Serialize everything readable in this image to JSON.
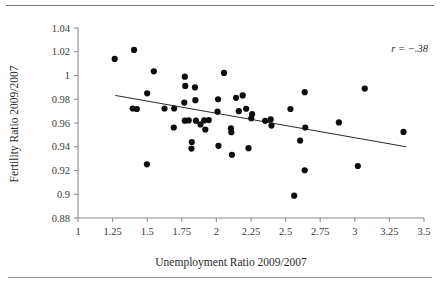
{
  "chart_data": {
    "type": "scatter",
    "title": "",
    "xlabel": "Unemployment Ratio 2009/2007",
    "ylabel": "Fertility Ratio 2009/2007",
    "xlim": [
      1,
      3.5
    ],
    "ylim": [
      0.88,
      1.04
    ],
    "xticks": [
      "1",
      "1.25",
      "1.5",
      "1.75",
      "2",
      "2.25",
      "2.5",
      "2.75",
      "3",
      "3.25",
      "3.5"
    ],
    "xtick_values": [
      1,
      1.25,
      1.5,
      1.75,
      2,
      2.25,
      2.5,
      2.75,
      3,
      3.25,
      3.5
    ],
    "yticks": [
      "1.04",
      "1.02",
      "1",
      "0.98",
      "0.96",
      "0.94",
      "0.92",
      "0.9",
      "0.88"
    ],
    "ytick_values": [
      1.04,
      1.02,
      1.0,
      0.98,
      0.96,
      0.94,
      0.92,
      0.9,
      0.88
    ],
    "grid": false,
    "legend": null,
    "annotation": "r = −.38",
    "correlation": -0.38,
    "marker": "filled-circle",
    "marker_color": "#0d0d0d",
    "trendline": {
      "type": "linear",
      "x": [
        1.27,
        3.37
      ],
      "y": [
        0.9832,
        0.94
      ],
      "color": "#2a2a2a"
    },
    "points": [
      {
        "x": 1.265,
        "y": 1.014
      },
      {
        "x": 1.405,
        "y": 1.0215
      },
      {
        "x": 1.395,
        "y": 0.9722
      },
      {
        "x": 1.425,
        "y": 0.9718
      },
      {
        "x": 1.5,
        "y": 0.985
      },
      {
        "x": 1.498,
        "y": 0.9252
      },
      {
        "x": 1.548,
        "y": 1.0035
      },
      {
        "x": 1.625,
        "y": 0.9722
      },
      {
        "x": 1.695,
        "y": 0.9722
      },
      {
        "x": 1.692,
        "y": 0.9562
      },
      {
        "x": 1.772,
        "y": 0.999
      },
      {
        "x": 1.775,
        "y": 0.9912
      },
      {
        "x": 1.768,
        "y": 0.9772
      },
      {
        "x": 1.772,
        "y": 0.962
      },
      {
        "x": 1.8,
        "y": 0.9622
      },
      {
        "x": 1.822,
        "y": 0.944
      },
      {
        "x": 1.82,
        "y": 0.9385
      },
      {
        "x": 1.845,
        "y": 0.99
      },
      {
        "x": 1.848,
        "y": 0.9792
      },
      {
        "x": 1.852,
        "y": 0.962
      },
      {
        "x": 1.885,
        "y": 0.9588
      },
      {
        "x": 1.912,
        "y": 0.9622
      },
      {
        "x": 1.92,
        "y": 0.9545
      },
      {
        "x": 1.945,
        "y": 0.9625
      },
      {
        "x": 2.012,
        "y": 0.98
      },
      {
        "x": 2.008,
        "y": 0.9695
      },
      {
        "x": 2.015,
        "y": 0.9408
      },
      {
        "x": 2.055,
        "y": 1.0022
      },
      {
        "x": 2.105,
        "y": 0.9555
      },
      {
        "x": 2.108,
        "y": 0.9522
      },
      {
        "x": 2.112,
        "y": 0.9332
      },
      {
        "x": 2.142,
        "y": 0.9812
      },
      {
        "x": 2.162,
        "y": 0.97
      },
      {
        "x": 2.19,
        "y": 0.9832
      },
      {
        "x": 2.215,
        "y": 0.972
      },
      {
        "x": 2.232,
        "y": 0.9388
      },
      {
        "x": 2.258,
        "y": 0.9675
      },
      {
        "x": 2.252,
        "y": 0.964
      },
      {
        "x": 2.352,
        "y": 0.9618
      },
      {
        "x": 2.392,
        "y": 0.963
      },
      {
        "x": 2.398,
        "y": 0.9578
      },
      {
        "x": 2.535,
        "y": 0.9718
      },
      {
        "x": 2.562,
        "y": 0.8988
      },
      {
        "x": 2.605,
        "y": 0.9452
      },
      {
        "x": 2.638,
        "y": 0.986
      },
      {
        "x": 2.642,
        "y": 0.9562
      },
      {
        "x": 2.638,
        "y": 0.9202
      },
      {
        "x": 2.885,
        "y": 0.9605
      },
      {
        "x": 3.022,
        "y": 0.9238
      },
      {
        "x": 3.072,
        "y": 0.989
      },
      {
        "x": 3.352,
        "y": 0.9525
      }
    ]
  }
}
